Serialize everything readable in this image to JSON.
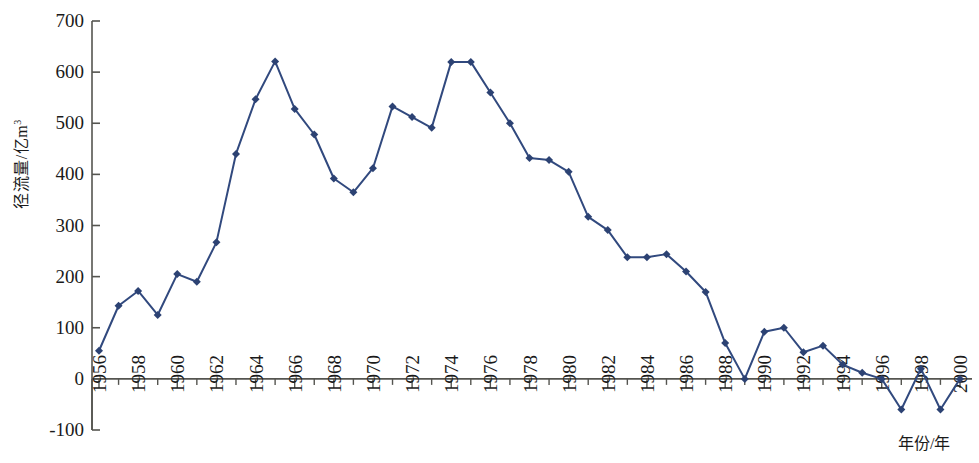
{
  "chart_data": {
    "type": "line",
    "title": "",
    "subtitle": "",
    "xlabel": "年份/年",
    "ylabel": "径流量/亿m³",
    "ylabel_base": "径流量/亿m",
    "ylabel_sup": "3",
    "xlim": [
      1955.5,
      2000.5
    ],
    "ylim": [
      -100,
      700
    ],
    "ytick_values": [
      -100,
      0,
      100,
      200,
      300,
      400,
      500,
      600,
      700
    ],
    "ytick_labels": [
      "-100",
      "0",
      "100",
      "200",
      "300",
      "400",
      "500",
      "600",
      "700"
    ],
    "xtick_values": [
      1956,
      1958,
      1960,
      1962,
      1964,
      1966,
      1968,
      1970,
      1972,
      1974,
      1976,
      1978,
      1980,
      1982,
      1984,
      1986,
      1988,
      1990,
      1992,
      1994,
      1996,
      1998,
      2000
    ],
    "xtick_labels": [
      "1956",
      "1958",
      "1960",
      "1962",
      "1964",
      "1966",
      "1968",
      "1970",
      "1972",
      "1974",
      "1976",
      "1978",
      "1980",
      "1982",
      "1984",
      "1986",
      "1988",
      "1990",
      "1992",
      "1994",
      "1996",
      "1998",
      "2000"
    ],
    "grid": false,
    "legend": null,
    "marker": "diamond",
    "line_color": "#31497e",
    "marker_color": "#2c4273",
    "axis_color": "#555550",
    "background": "#ffffff",
    "x": [
      1956,
      1957,
      1958,
      1959,
      1960,
      1961,
      1962,
      1963,
      1964,
      1965,
      1966,
      1967,
      1968,
      1969,
      1970,
      1971,
      1972,
      1973,
      1974,
      1975,
      1976,
      1977,
      1978,
      1979,
      1980,
      1981,
      1982,
      1983,
      1984,
      1985,
      1986,
      1987,
      1988,
      1989,
      1990,
      1991,
      1992,
      1993,
      1994,
      1995,
      1996,
      1997,
      1998,
      1999,
      2000
    ],
    "values": [
      55,
      143,
      172,
      125,
      205,
      190,
      267,
      440,
      547,
      621,
      528,
      478,
      392,
      365,
      412,
      533,
      512,
      491,
      620,
      620,
      560,
      500,
      432,
      428,
      405,
      317,
      291,
      238,
      238,
      244,
      210,
      170,
      70,
      0,
      92,
      100,
      52,
      65,
      28,
      12,
      0,
      -60,
      20,
      -60,
      0
    ],
    "series": [
      {
        "name": "径流量",
        "values": [
          55,
          143,
          172,
          125,
          205,
          190,
          267,
          440,
          547,
          621,
          528,
          478,
          392,
          365,
          412,
          533,
          512,
          491,
          620,
          620,
          560,
          500,
          432,
          428,
          405,
          317,
          291,
          238,
          238,
          244,
          210,
          170,
          70,
          0,
          92,
          100,
          52,
          65,
          28,
          12,
          0,
          -60,
          20,
          -60,
          0
        ]
      }
    ]
  }
}
